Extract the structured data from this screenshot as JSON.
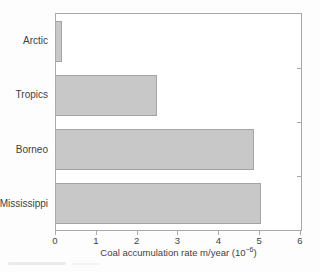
{
  "chart_data": {
    "type": "bar",
    "orientation": "horizontal",
    "title": "",
    "categories": [
      "Arctic",
      "Tropics",
      "Borneo",
      "Mississippi"
    ],
    "values": [
      0.15,
      2.5,
      4.9,
      5.05
    ],
    "x_ticks": [
      0,
      1,
      2,
      3,
      4,
      5,
      6
    ],
    "xlim": [
      0,
      6.05
    ],
    "xlabel_full": "Coal accumulation rate m/year (10−6)",
    "xlabel_prefix": "Coal accumulation rate m/year (10",
    "xlabel_superscript": "−6",
    "xlabel_suffix": ")",
    "ylabel": "",
    "grid": "off",
    "legend": "none",
    "bar_color": "#c8c8c8",
    "bar_border_color": "#a4a4a4",
    "axis_color": "#a9a9a9",
    "text_color": "#3f3f3f"
  }
}
